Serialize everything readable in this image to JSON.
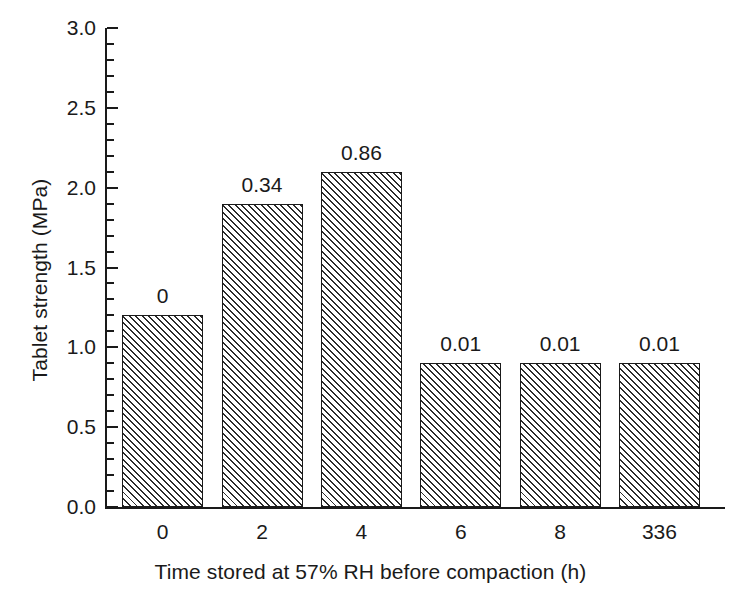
{
  "chart_data": {
    "type": "bar",
    "title": "",
    "xlabel": "Time stored at 57% RH before compaction (h)",
    "ylabel": "Tablet strength (MPa)",
    "categories": [
      "0",
      "2",
      "4",
      "6",
      "8",
      "336"
    ],
    "values": [
      1.2,
      1.9,
      2.1,
      0.9,
      0.9,
      0.9
    ],
    "point_labels": [
      "0",
      "0.34",
      "0.86",
      "0.01",
      "0.01",
      "0.01"
    ],
    "ylim": [
      0.0,
      3.0
    ],
    "xlim": [
      0,
      6
    ],
    "ytick_labels": [
      "0.0",
      "0.5",
      "1.0",
      "1.5",
      "2.0",
      "2.5",
      "3.0"
    ],
    "ytick_values": [
      0.0,
      0.5,
      1.0,
      1.5,
      2.0,
      2.5,
      3.0
    ],
    "yminor_step": 0.1,
    "grid": false,
    "legend": false,
    "bar_fill": "hatch-diagonal-45",
    "bar_edge_color": "#1a1a1a",
    "axis_color": "#1a1a1a",
    "background": "#ffffff"
  }
}
